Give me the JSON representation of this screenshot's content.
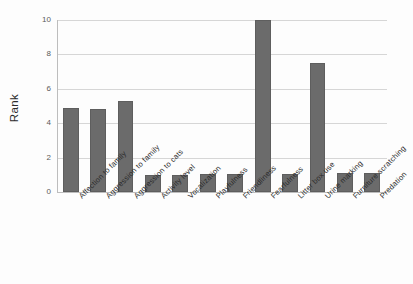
{
  "chart_data": {
    "type": "bar",
    "title": "",
    "xlabel": "",
    "ylabel": "Rank",
    "ylim": [
      0,
      10
    ],
    "yticks": [
      0,
      2,
      4,
      6,
      8,
      10
    ],
    "grid": true,
    "legend": "none",
    "bar_color": "#6b6b6b",
    "categories": [
      "Affection to family",
      "Aggression to family",
      "Aggression to cats",
      "Activity level",
      "Vocalization",
      "Playfulness",
      "Friendliness",
      "Fearfulness",
      "Litter box use",
      "Urine marking",
      "Furniture scratching",
      "Predation"
    ],
    "values": [
      4.9,
      4.85,
      5.3,
      1.0,
      1.0,
      1.05,
      1.05,
      10.0,
      1.05,
      7.5,
      1.1,
      1.1
    ]
  },
  "axes": {
    "y_title": "Rank",
    "y_tick_labels": [
      "0",
      "2",
      "4",
      "6",
      "8",
      "10"
    ]
  }
}
